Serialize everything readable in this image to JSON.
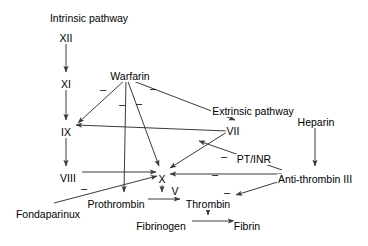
{
  "diagram": {
    "type": "flow-diagram",
    "background_color": "#ffffff",
    "line_color": "#3a3a3a",
    "text_color": "#000000",
    "nodes": [
      {
        "id": "intrinsic_pathway",
        "label": "Intrinsic pathway",
        "x": 89,
        "y": 13,
        "align": "center"
      },
      {
        "id": "factor_xii",
        "label": "XII",
        "x": 66,
        "y": 33,
        "align": "center"
      },
      {
        "id": "factor_xi",
        "label": "XI",
        "x": 66,
        "y": 79,
        "align": "center"
      },
      {
        "id": "factor_ix",
        "label": "IX",
        "x": 66,
        "y": 127,
        "align": "center"
      },
      {
        "id": "factor_viii",
        "label": "VIII",
        "x": 68,
        "y": 173,
        "align": "center"
      },
      {
        "id": "warfarin",
        "label": "Warfarin",
        "x": 130,
        "y": 71,
        "align": "center"
      },
      {
        "id": "extrinsic_pathway",
        "label": "Extrinsic pathway",
        "x": 253,
        "y": 106,
        "align": "center"
      },
      {
        "id": "factor_vii",
        "label": "VII",
        "x": 233,
        "y": 126,
        "align": "center"
      },
      {
        "id": "heparin",
        "label": "Heparin",
        "x": 316,
        "y": 117,
        "align": "center"
      },
      {
        "id": "pt_inr",
        "label": "PT/INR",
        "x": 254,
        "y": 154,
        "align": "center"
      },
      {
        "id": "anti_thrombin_iii",
        "label": "Anti-thrombin III",
        "x": 315,
        "y": 174,
        "align": "center"
      },
      {
        "id": "factor_x",
        "label": "X",
        "x": 162,
        "y": 174,
        "align": "center"
      },
      {
        "id": "factor_v",
        "label": "V",
        "x": 175,
        "y": 186,
        "align": "center"
      },
      {
        "id": "prothrombin",
        "label": "Prothrombin",
        "x": 116,
        "y": 199,
        "align": "center"
      },
      {
        "id": "thrombin",
        "label": "Thrombin",
        "x": 208,
        "y": 199,
        "align": "center"
      },
      {
        "id": "fondaparinux",
        "label": "Fondaparinux",
        "x": 48,
        "y": 209,
        "align": "center"
      },
      {
        "id": "fibrinogen",
        "label": "Fibrinogen",
        "x": 161,
        "y": 221,
        "align": "center"
      },
      {
        "id": "fibrin",
        "label": "Fibrin",
        "x": 247,
        "y": 221,
        "align": "center"
      }
    ],
    "signs": [
      {
        "id": "minus_warfarin_ix",
        "label": "–",
        "x": 103,
        "y": 84
      },
      {
        "id": "minus_warfarin_vii",
        "label": "–",
        "x": 153,
        "y": 83
      },
      {
        "id": "minus_warfarin_prothrombin",
        "label": "–",
        "x": 122,
        "y": 99
      },
      {
        "id": "minus_warfarin_x",
        "label": "–",
        "x": 139,
        "y": 98
      },
      {
        "id": "minus_fondaparinux_x",
        "label": "–",
        "x": 84,
        "y": 183
      },
      {
        "id": "minus_at3_vii",
        "label": "–",
        "x": 224,
        "y": 151
      },
      {
        "id": "minus_at3_x",
        "label": "–",
        "x": 215,
        "y": 169
      },
      {
        "id": "minus_at3_thrombin",
        "label": "–",
        "x": 227,
        "y": 187
      }
    ],
    "edges": [
      {
        "id": "edge-xii-to-xi",
        "from": "factor_xii",
        "to": "factor_xi",
        "kind": "activation"
      },
      {
        "id": "edge-xi-to-ix",
        "from": "factor_xi",
        "to": "factor_ix",
        "kind": "activation"
      },
      {
        "id": "edge-ix-to-viii",
        "from": "factor_ix",
        "to": "factor_viii",
        "kind": "activation"
      },
      {
        "id": "edge-viii-to-x",
        "from": "factor_viii",
        "to": "factor_x",
        "kind": "activation"
      },
      {
        "id": "edge-vii-to-ix",
        "from": "factor_vii",
        "to": "factor_ix",
        "kind": "activation"
      },
      {
        "id": "edge-vii-to-x",
        "from": "factor_vii",
        "to": "factor_x",
        "kind": "activation"
      },
      {
        "id": "edge-x-to-prothrombin",
        "from": "factor_x",
        "to": "prothrombin",
        "kind": "activation"
      },
      {
        "id": "edge-prothrombin-thrombin",
        "from": "prothrombin",
        "to": "thrombin",
        "kind": "activation"
      },
      {
        "id": "edge-thrombin-fibrinogen",
        "from": "thrombin",
        "to": "fibrinogen",
        "kind": "activation"
      },
      {
        "id": "edge-fibrinogen-fibrin",
        "from": "fibrinogen",
        "to": "fibrin",
        "kind": "activation"
      },
      {
        "id": "edge-heparin-at3",
        "from": "heparin",
        "to": "anti_thrombin_iii",
        "kind": "activation"
      },
      {
        "id": "edge-warfarin-ix",
        "from": "warfarin",
        "to": "factor_ix",
        "kind": "inhibition"
      },
      {
        "id": "edge-warfarin-prothrombin",
        "from": "warfarin",
        "to": "prothrombin",
        "kind": "inhibition"
      },
      {
        "id": "edge-warfarin-x",
        "from": "warfarin",
        "to": "factor_x",
        "kind": "inhibition"
      },
      {
        "id": "edge-warfarin-vii",
        "from": "warfarin",
        "to": "factor_vii",
        "kind": "inhibition"
      },
      {
        "id": "edge-fondaparinux-x",
        "from": "fondaparinux",
        "to": "factor_x",
        "kind": "inhibition"
      },
      {
        "id": "edge-at3-vii",
        "from": "anti_thrombin_iii",
        "to": "factor_vii",
        "kind": "inhibition"
      },
      {
        "id": "edge-at3-x",
        "from": "anti_thrombin_iii",
        "to": "factor_x",
        "kind": "inhibition"
      },
      {
        "id": "edge-at3-thrombin",
        "from": "anti_thrombin_iii",
        "to": "thrombin",
        "kind": "inhibition"
      }
    ]
  }
}
